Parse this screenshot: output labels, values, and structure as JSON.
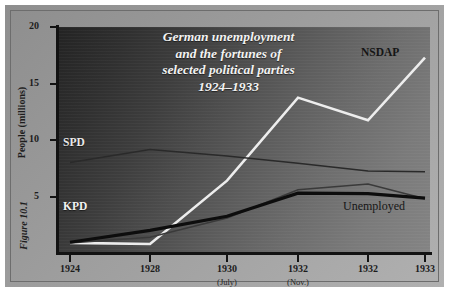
{
  "figure": {
    "caption": "Figure 10.1"
  },
  "chart_data": {
    "type": "line",
    "title_lines": [
      "German unemployment",
      "and the fortunes of",
      "selected political parties",
      "1924–1933"
    ],
    "xlabel": "",
    "ylabel": "People (millions)",
    "ylim": [
      0,
      20
    ],
    "yticks": [
      5,
      10,
      15,
      20
    ],
    "ytick_labels": [
      "5",
      "10",
      "15",
      "20"
    ],
    "grid": false,
    "legend": "inline-labels",
    "categories": [
      "1924",
      "1928",
      "1930",
      "1932",
      "1932",
      "1933"
    ],
    "category_sublabels": [
      "",
      "",
      "(July)",
      "(Nov.)",
      "",
      ""
    ],
    "series": [
      {
        "name": "NSDAP",
        "color": "#ededed",
        "width": 2.6,
        "values": [
          0.9,
          0.8,
          6.4,
          13.75,
          11.74,
          17.3
        ]
      },
      {
        "name": "SPD",
        "color": "#2a2a2a",
        "width": 1.5,
        "values": [
          8.0,
          9.15,
          8.58,
          7.95,
          7.25,
          7.2
        ]
      },
      {
        "name": "Unemployed",
        "color": "#3a3a3a",
        "width": 1.6,
        "values": [
          0.9,
          1.4,
          3.1,
          5.6,
          6.1,
          4.8
        ]
      },
      {
        "name": "KPD",
        "color": "#0d0d0d",
        "width": 3.2,
        "values": [
          0.95,
          2.0,
          3.25,
          5.3,
          5.25,
          4.85
        ]
      }
    ]
  },
  "labels": {
    "nsdap": "NSDAP",
    "spd": "SPD",
    "kpd": "KPD",
    "unemployed": "Unemployed"
  }
}
